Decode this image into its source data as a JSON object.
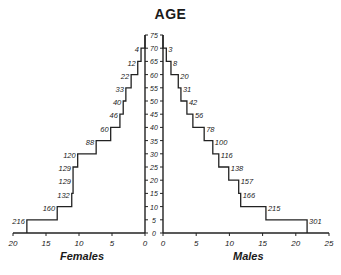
{
  "chart_data": {
    "type": "bar",
    "subtype": "population-pyramid",
    "title": "AGE",
    "xlabel_left": "Females",
    "xlabel_right": "Males",
    "ylabel": "AGE",
    "age_ticks": [
      0,
      5,
      10,
      15,
      20,
      25,
      30,
      35,
      40,
      45,
      50,
      55,
      60,
      65,
      70,
      75
    ],
    "female_x_ticks": [
      20,
      15,
      10,
      5,
      0
    ],
    "male_x_ticks": [
      0,
      5,
      10,
      15,
      20,
      25
    ],
    "xlim_left": [
      20,
      0
    ],
    "xlim_right": [
      0,
      25
    ],
    "ylim": [
      0,
      75
    ],
    "grid": false,
    "categories": [
      "0-5",
      "5-10",
      "10-15",
      "15-20",
      "20-25",
      "25-30",
      "30-35",
      "35-40",
      "40-45",
      "45-50",
      "50-55",
      "55-60",
      "60-65",
      "65-70",
      "70-75"
    ],
    "series": [
      {
        "name": "Females",
        "side": "left",
        "values": [
          17.9,
          13.3,
          11.1,
          10.9,
          10.9,
          10.2,
          7.4,
          5.2,
          3.8,
          3.3,
          2.9,
          2.1,
          1.1,
          0.6,
          0
        ],
        "counts": [
          216,
          160,
          132,
          129,
          129,
          120,
          88,
          60,
          46,
          40,
          33,
          22,
          12,
          4,
          null
        ]
      },
      {
        "name": "Males",
        "side": "right",
        "values": [
          21.7,
          15.5,
          11.7,
          11.4,
          9.9,
          8.4,
          7.5,
          6.2,
          4.5,
          3.6,
          2.7,
          2.3,
          1.2,
          0.5,
          0
        ],
        "counts": [
          301,
          215,
          166,
          157,
          138,
          116,
          100,
          78,
          56,
          42,
          31,
          20,
          8,
          3,
          null
        ]
      }
    ]
  }
}
